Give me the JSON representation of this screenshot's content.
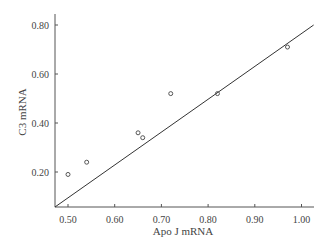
{
  "chart_data": {
    "type": "scatter",
    "title": "",
    "xlabel": "Apo J mRNA",
    "ylabel": "C3 mRNA",
    "xlim": [
      0.472,
      1.026
    ],
    "ylim": [
      0.057,
      0.85
    ],
    "x_ticks": [
      0.5,
      0.6,
      0.7,
      0.8,
      0.9,
      1.0
    ],
    "x_tick_labels": [
      "0.50",
      "0.60",
      "0.70",
      "0.80",
      "0.90",
      "1.00"
    ],
    "y_ticks": [
      0.2,
      0.4,
      0.6,
      0.8
    ],
    "y_tick_labels": [
      "0.20",
      "0.40",
      "0.60",
      "0.80"
    ],
    "grid": false,
    "legend": null,
    "series": [
      {
        "name": "samples",
        "marker": "open-circle",
        "points": [
          {
            "x": 0.5,
            "y": 0.19
          },
          {
            "x": 0.54,
            "y": 0.24
          },
          {
            "x": 0.65,
            "y": 0.36
          },
          {
            "x": 0.66,
            "y": 0.34
          },
          {
            "x": 0.72,
            "y": 0.52
          },
          {
            "x": 0.82,
            "y": 0.52
          },
          {
            "x": 0.97,
            "y": 0.71
          }
        ]
      }
    ],
    "fit_line": {
      "x0": 0.472,
      "y0": 0.057,
      "x1": 1.026,
      "y1": 0.8
    },
    "colors": {
      "axis": "#555555",
      "marker": "#555555",
      "line": "#333333"
    }
  }
}
